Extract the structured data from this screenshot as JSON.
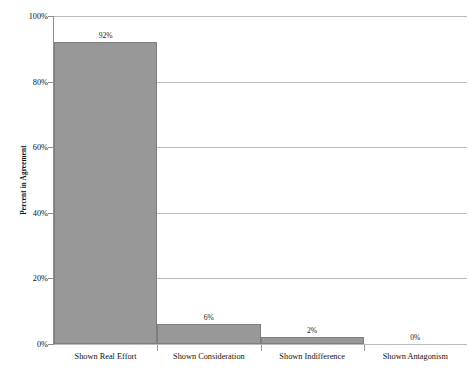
{
  "chart_data": {
    "type": "bar",
    "title": "",
    "subtitle": "",
    "xlabel": "",
    "ylabel": "Percent in Agreement",
    "categories": [
      "Shown Real Effort",
      "Shown Consideration",
      "Shown Indifference",
      "Shown Antagonism"
    ],
    "values": [
      92,
      6,
      2,
      0
    ],
    "data_labels": [
      "92%",
      "6%",
      "2%",
      "0%"
    ],
    "ylim": [
      0,
      100
    ],
    "ytick_values": [
      0,
      20,
      40,
      60,
      80,
      100
    ],
    "ytick_labels": [
      "0%",
      "20%",
      "40%",
      "60%",
      "80%",
      "100%"
    ],
    "grid": "horizontal",
    "legend": "none",
    "bar_color": "#989898",
    "bar_border_color": "#7e7e7e",
    "gridline_color": "#b9b9b9",
    "axis_color": "#8d8d8d",
    "background_color": "#ffffff"
  }
}
